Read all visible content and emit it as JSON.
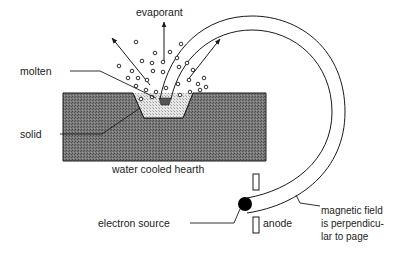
{
  "diagram": {
    "labels": {
      "evaporant": "evaporant",
      "molten": "molten",
      "solid": "solid",
      "hearth": "water cooled hearth",
      "electron_source": "electron source",
      "anode": "anode",
      "magnetic_field_line1": "magnetic field",
      "magnetic_field_line2": "is perpendicu-",
      "magnetic_field_line3": "lar to page"
    },
    "colors": {
      "hearth_fill": "#6e6e6e",
      "molten_fill": "#d9d9d9",
      "stroke": "#1a1a1a",
      "source": "#000000",
      "background": "#ffffff"
    },
    "particles": [
      [
        136,
        42
      ],
      [
        155,
        53
      ],
      [
        181,
        44
      ],
      [
        119,
        66
      ],
      [
        142,
        61
      ],
      [
        152,
        63
      ],
      [
        163,
        62
      ],
      [
        177,
        58
      ],
      [
        128,
        78
      ],
      [
        138,
        78
      ],
      [
        147,
        80
      ],
      [
        153,
        71
      ],
      [
        163,
        72
      ],
      [
        179,
        67
      ],
      [
        187,
        63
      ],
      [
        193,
        70
      ],
      [
        136,
        86
      ],
      [
        146,
        90
      ],
      [
        156,
        92
      ],
      [
        166,
        88
      ],
      [
        178,
        84
      ],
      [
        189,
        80
      ],
      [
        198,
        84
      ],
      [
        204,
        78
      ],
      [
        141,
        99
      ],
      [
        152,
        97
      ],
      [
        180,
        95
      ],
      [
        190,
        92
      ],
      [
        200,
        90
      ],
      [
        206,
        87
      ],
      [
        132,
        71
      ],
      [
        170,
        52
      ]
    ]
  }
}
